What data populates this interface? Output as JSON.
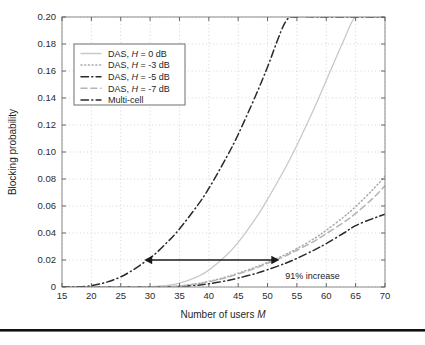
{
  "figure": {
    "background": "#ffffff",
    "bottom_rule_color": "#111111"
  },
  "axes": {
    "x_title_prefix": "Number of users ",
    "x_title_italic": "M",
    "y_title": "Blocking probability",
    "x_ticks": [
      "15",
      "20",
      "25",
      "30",
      "35",
      "40",
      "45",
      "50",
      "55",
      "60",
      "65",
      "70"
    ],
    "y_ticks": [
      "0",
      "0.02",
      "0.04",
      "0.06",
      "0.08",
      "0.10",
      "0.12",
      "0.14",
      "0.16",
      "0.18",
      "0.20"
    ]
  },
  "legend": {
    "items": [
      {
        "label_prefix": "DAS, ",
        "label_italic": "H",
        "label_suffix": " = 0 dB",
        "style": "solid",
        "color": "#c9c9c9"
      },
      {
        "label_prefix": "DAS, ",
        "label_italic": "H",
        "label_suffix": " = -3 dB",
        "style": "dotted",
        "color": "#a9a9a9"
      },
      {
        "label_prefix": "DAS, ",
        "label_italic": "H",
        "label_suffix": " = -5 dB",
        "style": "dashdot",
        "color": "#2a2a2a"
      },
      {
        "label_prefix": "DAS, ",
        "label_italic": "H",
        "label_suffix": " = -7 dB",
        "style": "dashed",
        "color": "#b4b4b4"
      },
      {
        "label_prefix": "Multi-cell",
        "label_italic": "",
        "label_suffix": "",
        "style": "dashdot",
        "color": "#2a2a2a"
      }
    ]
  },
  "annotation": {
    "text": "91% increase",
    "arrow_start_x": 29,
    "arrow_end_x": 52,
    "arrow_y": 0.02,
    "color": "#1a1a1a"
  },
  "chart_data": {
    "type": "line",
    "title": "",
    "xlabel": "Number of users M",
    "ylabel": "Blocking probability",
    "xlim": [
      15,
      70
    ],
    "ylim": [
      0,
      0.2
    ],
    "xticks": [
      15,
      20,
      25,
      30,
      35,
      40,
      45,
      50,
      55,
      60,
      65,
      70
    ],
    "yticks": [
      0,
      0.02,
      0.04,
      0.06,
      0.08,
      0.1,
      0.12,
      0.14,
      0.16,
      0.18,
      0.2
    ],
    "grid": true,
    "legend_position": "upper-left",
    "x": [
      15,
      20,
      25,
      30,
      33,
      35,
      38,
      40,
      43,
      45,
      48,
      50,
      53,
      55,
      58,
      60,
      63,
      65,
      68,
      70
    ],
    "series": [
      {
        "name": "DAS, H = 0 dB",
        "style": "solid",
        "color": "#c9c9c9",
        "values": [
          0,
          0,
          0,
          0.0002,
          0.0012,
          0.0028,
          0.0075,
          0.0125,
          0.0235,
          0.033,
          0.051,
          0.065,
          0.088,
          0.105,
          0.133,
          0.153,
          0.183,
          0.2,
          0.2,
          0.2
        ]
      },
      {
        "name": "DAS, H = -3 dB",
        "style": "dotted",
        "color": "#a9a9a9",
        "values": [
          0,
          0,
          0,
          0,
          0.0002,
          0.0008,
          0.0025,
          0.0042,
          0.0075,
          0.0102,
          0.0148,
          0.0182,
          0.024,
          0.0285,
          0.036,
          0.042,
          0.052,
          0.0595,
          0.0725,
          0.082
        ]
      },
      {
        "name": "DAS, H = -5 dB",
        "style": "dashdot",
        "color": "#2a2a2a",
        "values": [
          0,
          0,
          0,
          0,
          0.0001,
          0.0004,
          0.0013,
          0.0024,
          0.0046,
          0.0066,
          0.01,
          0.0128,
          0.0175,
          0.0212,
          0.0275,
          0.0322,
          0.04,
          0.0455,
          0.0508,
          0.054
        ]
      },
      {
        "name": "DAS, H = -7 dB",
        "style": "dashed",
        "color": "#b4b4b4",
        "values": [
          0,
          0,
          0,
          0,
          0.0002,
          0.0007,
          0.0022,
          0.0038,
          0.007,
          0.0096,
          0.014,
          0.0175,
          0.023,
          0.0272,
          0.034,
          0.0395,
          0.048,
          0.0545,
          0.066,
          0.075
        ]
      },
      {
        "name": "Multi-cell",
        "style": "dashdot",
        "color": "#2a2a2a",
        "values": [
          0,
          0.001,
          0.0075,
          0.0215,
          0.0335,
          0.043,
          0.06,
          0.073,
          0.096,
          0.113,
          0.142,
          0.163,
          0.196,
          0.2,
          0.2,
          0.2,
          0.2,
          0.2,
          0.2,
          0.2
        ]
      }
    ]
  }
}
